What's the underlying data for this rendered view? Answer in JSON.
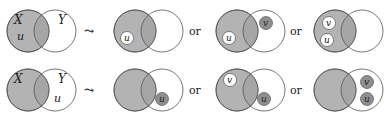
{
  "colors": {
    "shaded": "#b3b3b3",
    "overlap": "#a6a6a6",
    "stroke": "#555555",
    "element_dark": "#8f8f8f",
    "element_light": "#ffffff",
    "text": "#222222"
  },
  "labels": {
    "set_x": "X",
    "set_y": "Y",
    "arrow": "⤳",
    "or": "or"
  },
  "rows": [
    {
      "name": "row-u-in-x",
      "initial": {
        "u_label": "u",
        "u_region": "X"
      },
      "outcomes": [
        {
          "elements": [
            {
              "label": "u",
              "style": "light",
              "region": "X-only"
            }
          ]
        },
        {
          "elements": [
            {
              "label": "u",
              "style": "light",
              "region": "X-only"
            },
            {
              "label": "v",
              "style": "dark",
              "region": "Y-only"
            }
          ]
        },
        {
          "elements": [
            {
              "label": "v",
              "style": "light",
              "region": "X-only"
            },
            {
              "label": "u",
              "style": "light",
              "region": "X-only"
            }
          ]
        }
      ]
    },
    {
      "name": "row-u-in-y",
      "initial": {
        "u_label": "u",
        "u_region": "Y"
      },
      "outcomes": [
        {
          "elements": [
            {
              "label": "u",
              "style": "dark",
              "region": "Y-only"
            }
          ]
        },
        {
          "elements": [
            {
              "label": "v",
              "style": "light",
              "region": "X-only"
            },
            {
              "label": "u",
              "style": "dark",
              "region": "Y-only"
            }
          ]
        },
        {
          "elements": [
            {
              "label": "v",
              "style": "dark",
              "region": "Y-only"
            },
            {
              "label": "u",
              "style": "dark",
              "region": "Y-only"
            }
          ]
        }
      ]
    }
  ]
}
